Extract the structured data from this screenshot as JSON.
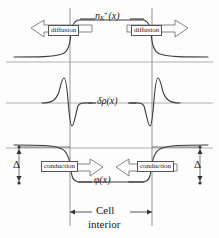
{
  "figure": {
    "background_color": "#fdfdfd",
    "line_color": "#4a4a4a",
    "curve_color": "#3a3a3a",
    "text_color": "#1a1a1a",
    "width": 219,
    "height": 238
  },
  "panels": [
    {
      "id": "concentration",
      "curve_label_main": "n",
      "curve_label_sub": "K",
      "curve_label_sup": "+",
      "curve_label_arg": "(x)",
      "baseline_y": 62,
      "description": "potassium ion concentration profile"
    },
    {
      "id": "charge-density",
      "curve_label": "δρ(x)",
      "baseline_y": 103,
      "description": "charge density profile with bipolar spikes"
    },
    {
      "id": "potential",
      "curve_label": "φ(x)",
      "baseline_y": 148,
      "description": "electric potential profile"
    }
  ],
  "arrows": {
    "diffusion_left": "diffusion",
    "diffusion_right": "diffusion",
    "conduction_left": "conduction",
    "conduction_right": "conduction"
  },
  "delta_markers": {
    "left_label": "Δ",
    "right_label": "Δ"
  },
  "caption": {
    "line1": "Cell",
    "line2": "interior"
  },
  "membrane": {
    "left_x": 70,
    "right_x": 152
  }
}
